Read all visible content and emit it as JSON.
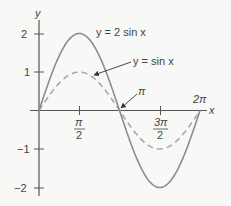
{
  "chart_data": {
    "type": "line",
    "title": "",
    "xlabel": "x",
    "ylabel": "y",
    "xlim": [
      0,
      6.2832
    ],
    "ylim": [
      -2,
      2
    ],
    "x_ticks": [
      "π/2",
      "3π/2"
    ],
    "x_tick_values": [
      1.5708,
      4.7124
    ],
    "x_annotations": [
      "π",
      "2π"
    ],
    "y_ticks": [
      "2",
      "1",
      "−1",
      "−2"
    ],
    "y_tick_values": [
      2,
      1,
      -1,
      -2
    ],
    "grid": false,
    "series": [
      {
        "name": "y = 2 sin x",
        "style": "solid",
        "color": "#8c8c8c",
        "x": [
          0,
          0.7854,
          1.5708,
          2.3562,
          3.1416,
          3.927,
          4.7124,
          5.4978,
          6.2832
        ],
        "values": [
          0,
          1.414,
          2,
          1.414,
          0,
          -1.414,
          -2,
          -1.414,
          0
        ]
      },
      {
        "name": "y = sin x",
        "style": "dashed",
        "color": "#a8a8a8",
        "x": [
          0,
          0.7854,
          1.5708,
          2.3562,
          3.1416,
          3.927,
          4.7124,
          5.4978,
          6.2832
        ],
        "values": [
          0,
          0.707,
          1,
          0.707,
          0,
          -0.707,
          -1,
          -0.707,
          0
        ]
      }
    ],
    "annotations": [
      {
        "text": "y = 2 sin x",
        "target": "curve y = 2 sin x"
      },
      {
        "text": "y = sin x",
        "target": "curve y = sin x",
        "arrow": true
      },
      {
        "text": "π",
        "target": "x-intercept at π",
        "arrow": true
      }
    ]
  },
  "labels": {
    "y_axis": "y",
    "x_axis": "x",
    "y2": "2",
    "y1": "1",
    "ym1": "−1",
    "ym2": "−2",
    "pi_over_2_num": "π",
    "pi_over_2_den": "2",
    "three_pi_over_2_num": "3π",
    "three_pi_over_2_den": "2",
    "pi": "π",
    "two_pi": "2π",
    "curve_2sin": "y = 2 sin x",
    "curve_sin": "y = sin x"
  }
}
